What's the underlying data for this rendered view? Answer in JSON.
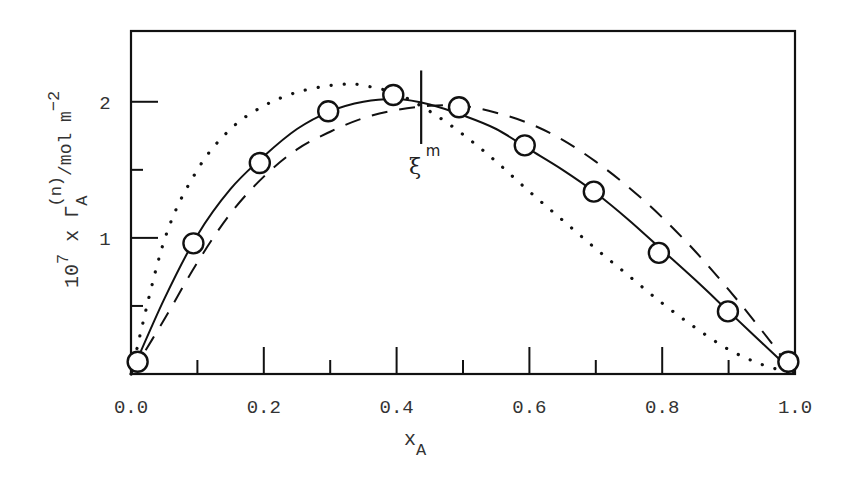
{
  "chart_data": {
    "type": "line",
    "title": "",
    "xlabel": "x_A",
    "xlabel_main": "x",
    "xlabel_sub": "A",
    "ylabel": "10^7 x Γ_A^(n)/mol m^-2",
    "ylabel_parts": {
      "prefix": "10",
      "prefix_sup": "7",
      "mid": " x Γ",
      "gamma_sub": "A",
      "gamma_sup": "(n)",
      "unit": "/mol m",
      "unit_sup": "−2"
    },
    "xlim": [
      0.0,
      1.0
    ],
    "ylim": [
      0.0,
      2.52
    ],
    "grid": false,
    "legend": null,
    "x_ticks": [
      {
        "value": 0.0,
        "label": "0.0",
        "major": true
      },
      {
        "value": 0.1,
        "label": "",
        "major": false
      },
      {
        "value": 0.2,
        "label": "0.2",
        "major": true
      },
      {
        "value": 0.3,
        "label": "",
        "major": false
      },
      {
        "value": 0.4,
        "label": "0.4",
        "major": true
      },
      {
        "value": 0.5,
        "label": "",
        "major": false
      },
      {
        "value": 0.6,
        "label": "0.6",
        "major": true
      },
      {
        "value": 0.7,
        "label": "",
        "major": false
      },
      {
        "value": 0.8,
        "label": "0.8",
        "major": true
      },
      {
        "value": 0.9,
        "label": "",
        "major": false
      },
      {
        "value": 1.0,
        "label": "1.0",
        "major": true
      }
    ],
    "y_ticks": [
      {
        "value": 0.5,
        "label": "",
        "major": false
      },
      {
        "value": 1.0,
        "label": "1",
        "major": true
      },
      {
        "value": 1.5,
        "label": "",
        "major": false
      },
      {
        "value": 2.0,
        "label": "2",
        "major": true
      }
    ],
    "series": [
      {
        "name": "experimental",
        "style": "circles",
        "x": [
          0.01,
          0.094,
          0.194,
          0.297,
          0.395,
          0.494,
          0.593,
          0.697,
          0.795,
          0.899,
          0.99
        ],
        "y": [
          0.09,
          0.96,
          1.55,
          1.93,
          2.05,
          1.96,
          1.68,
          1.34,
          0.89,
          0.46,
          0.09
        ]
      },
      {
        "name": "fit",
        "style": "solid",
        "x": [
          0.0,
          0.05,
          0.1,
          0.15,
          0.2,
          0.25,
          0.3,
          0.35,
          0.4,
          0.45,
          0.5,
          0.55,
          0.6,
          0.65,
          0.7,
          0.75,
          0.8,
          0.85,
          0.9,
          0.95,
          1.0
        ],
        "y": [
          0.0,
          0.55,
          1.02,
          1.36,
          1.6,
          1.8,
          1.93,
          2.0,
          2.02,
          1.98,
          1.9,
          1.8,
          1.65,
          1.5,
          1.33,
          1.13,
          0.91,
          0.69,
          0.46,
          0.23,
          0.0
        ]
      },
      {
        "name": "model-dotted",
        "style": "dotted",
        "x": [
          0.0,
          0.05,
          0.1,
          0.15,
          0.2,
          0.25,
          0.3,
          0.33,
          0.35,
          0.4,
          0.45,
          0.5,
          0.55,
          0.6,
          0.65,
          0.7,
          0.75,
          0.8,
          0.85,
          0.9,
          0.95,
          1.0
        ],
        "y": [
          0.0,
          0.98,
          1.5,
          1.8,
          1.97,
          2.07,
          2.12,
          2.13,
          2.12,
          2.06,
          1.93,
          1.76,
          1.56,
          1.34,
          1.13,
          0.92,
          0.72,
          0.52,
          0.34,
          0.18,
          0.07,
          0.0
        ]
      },
      {
        "name": "model-dashed",
        "style": "dashed",
        "x": [
          0.0,
          0.05,
          0.1,
          0.15,
          0.2,
          0.25,
          0.3,
          0.35,
          0.4,
          0.45,
          0.5,
          0.55,
          0.6,
          0.65,
          0.7,
          0.75,
          0.8,
          0.85,
          0.9,
          0.95,
          1.0
        ],
        "y": [
          0.0,
          0.4,
          0.82,
          1.18,
          1.45,
          1.65,
          1.78,
          1.88,
          1.94,
          1.97,
          1.97,
          1.92,
          1.84,
          1.72,
          1.56,
          1.37,
          1.15,
          0.9,
          0.62,
          0.32,
          0.0
        ]
      }
    ],
    "annotations": [
      {
        "type": "vline",
        "x": 0.437,
        "y_from": 1.69,
        "y_to": 2.23,
        "label": "ξ",
        "label_sup": "m"
      }
    ]
  }
}
